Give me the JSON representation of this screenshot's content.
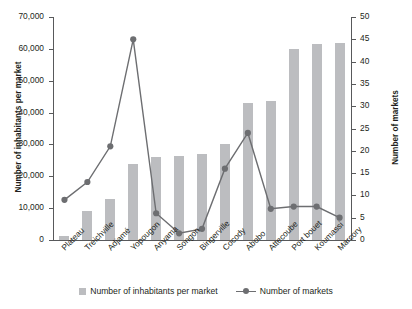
{
  "chart_data": {
    "type": "bar",
    "title": "",
    "categories": [
      "Plateau",
      "Treichville",
      "Adjamé",
      "Yopougon",
      "Anyama",
      "Songon",
      "Bingerville",
      "Cocody",
      "Abobo",
      "Attecoube",
      "Port bouet",
      "Koumassi",
      "Marcory"
    ],
    "series": [
      {
        "name": "Number of inhabitants per market",
        "type": "bar",
        "axis": "left",
        "values": [
          1200,
          9000,
          12800,
          24000,
          26000,
          26500,
          27000,
          30000,
          43000,
          43500,
          60000,
          61500,
          62000
        ]
      },
      {
        "name": "Number of markets",
        "type": "line",
        "axis": "right",
        "values": [
          9,
          13,
          21,
          45,
          6,
          1.5,
          2.5,
          16,
          24,
          7,
          7.5,
          7.5,
          5
        ]
      }
    ],
    "xlabel": "",
    "ylabel": "Number of inhabitants per market",
    "y2label": "Number of markets",
    "ylim": [
      0,
      70000
    ],
    "y2lim": [
      0,
      50
    ],
    "yticks": [
      "0",
      "10,000",
      "20,000",
      "30,000",
      "40,000",
      "50,000",
      "60,000",
      "70,000"
    ],
    "ytick_values": [
      0,
      10000,
      20000,
      30000,
      40000,
      50000,
      60000,
      70000
    ],
    "y2ticks": [
      "0",
      "5",
      "10",
      "15",
      "20",
      "25",
      "30",
      "35",
      "40",
      "45",
      "50"
    ],
    "y2tick_values": [
      0,
      5,
      10,
      15,
      20,
      25,
      30,
      35,
      40,
      45,
      50
    ],
    "grid": false,
    "legend_position": "bottom",
    "colors": {
      "bar": "#bcbdc0",
      "line": "#6d6e71",
      "axis": "#58595b",
      "text": "#231f20"
    }
  },
  "legend": {
    "items": [
      {
        "label": "Number of inhabitants per market",
        "marker": "bar-swatch"
      },
      {
        "label": "Number of markets",
        "marker": "line-marker"
      }
    ]
  }
}
